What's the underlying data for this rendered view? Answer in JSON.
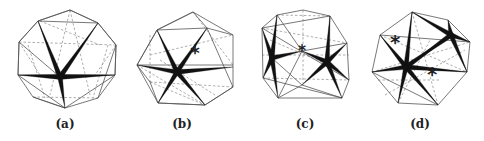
{
  "figure": {
    "panels": [
      {
        "id": "a",
        "label": "(a)",
        "label_x": 65,
        "outline": [
          [
            70,
            10
          ],
          [
            98,
            23
          ],
          [
            116,
            45
          ],
          [
            115,
            75
          ],
          [
            98,
            98
          ],
          [
            65,
            108
          ],
          [
            33,
            97
          ],
          [
            18,
            75
          ],
          [
            19,
            42
          ],
          [
            38,
            21
          ]
        ],
        "edges": [
          [
            [
              38,
              21
            ],
            [
              98,
              23
            ]
          ],
          [
            [
              38,
              21
            ],
            [
              19,
              42
            ]
          ],
          [
            [
              98,
              23
            ],
            [
              116,
              45
            ]
          ],
          [
            [
              19,
              42
            ],
            [
              18,
              75
            ]
          ],
          [
            [
              116,
              45
            ],
            [
              115,
              75
            ]
          ],
          [
            [
              18,
              75
            ],
            [
              115,
              75
            ]
          ],
          [
            [
              18,
              75
            ],
            [
              65,
              108
            ]
          ],
          [
            [
              115,
              75
            ],
            [
              65,
              108
            ]
          ],
          [
            [
              38,
              21
            ],
            [
              60,
              77
            ]
          ],
          [
            [
              98,
              23
            ],
            [
              60,
              77
            ]
          ],
          [
            [
              70,
              10
            ],
            [
              38,
              21
            ]
          ],
          [
            [
              70,
              10
            ],
            [
              98,
              23
            ]
          ],
          [
            [
              19,
              42
            ],
            [
              60,
              77
            ]
          ],
          [
            [
              116,
              45
            ],
            [
              98,
              98
            ]
          ],
          [
            [
              33,
              97
            ],
            [
              65,
              108
            ]
          ]
        ],
        "hidden_edges": [
          [
            [
              19,
              42
            ],
            [
              116,
              45
            ]
          ],
          [
            [
              70,
              10
            ],
            [
              50,
              95
            ]
          ],
          [
            [
              70,
              10
            ],
            [
              90,
              95
            ]
          ],
          [
            [
              28,
              45
            ],
            [
              45,
              98
            ]
          ],
          [
            [
              108,
              45
            ],
            [
              93,
              98
            ]
          ],
          [
            [
              33,
              97
            ],
            [
              98,
              98
            ]
          ],
          [
            [
              19,
              42
            ],
            [
              40,
              75
            ]
          ],
          [
            [
              116,
              45
            ],
            [
              95,
              75
            ]
          ],
          [
            [
              40,
              21
            ],
            [
              100,
              45
            ]
          ]
        ],
        "stars": [
          {
            "center": [
              60,
              77
            ],
            "tips": [
              [
                38,
                21
              ],
              [
                98,
                23
              ],
              [
                18,
                75
              ],
              [
                115,
                75
              ],
              [
                65,
                108
              ]
            ]
          }
        ],
        "asterisks": []
      },
      {
        "id": "b",
        "label": "(b)",
        "label_x": 182,
        "outline": [
          [
            193,
            12
          ],
          [
            233,
            35
          ],
          [
            233,
            87
          ],
          [
            205,
            105
          ],
          [
            158,
            103
          ],
          [
            150,
            82
          ],
          [
            137,
            65
          ],
          [
            157,
            30
          ]
        ],
        "edges": [
          [
            [
              157,
              30
            ],
            [
              207,
              28
            ]
          ],
          [
            [
              207,
              28
            ],
            [
              233,
              35
            ]
          ],
          [
            [
              193,
              12
            ],
            [
              157,
              30
            ]
          ],
          [
            [
              193,
              12
            ],
            [
              207,
              28
            ]
          ],
          [
            [
              157,
              30
            ],
            [
              137,
              65
            ]
          ],
          [
            [
              207,
              28
            ],
            [
              233,
              87
            ]
          ],
          [
            [
              137,
              65
            ],
            [
              233,
              65
            ]
          ],
          [
            [
              158,
              103
            ],
            [
              205,
              105
            ]
          ],
          [
            [
              137,
              65
            ],
            [
              158,
              103
            ]
          ],
          [
            [
              233,
              87
            ],
            [
              205,
              105
            ]
          ],
          [
            [
              157,
              30
            ],
            [
              177,
              72
            ]
          ],
          [
            [
              207,
              28
            ],
            [
              177,
              72
            ]
          ],
          [
            [
              177,
              72
            ],
            [
              158,
              103
            ]
          ],
          [
            [
              177,
              72
            ],
            [
              205,
              105
            ]
          ]
        ],
        "hidden_edges": [
          [
            [
              150,
              35
            ],
            [
              150,
              82
            ]
          ],
          [
            [
              150,
              82
            ],
            [
              233,
              87
            ]
          ],
          [
            [
              150,
              55
            ],
            [
              233,
              35
            ]
          ],
          [
            [
              137,
              65
            ],
            [
              205,
              105
            ]
          ],
          [
            [
              150,
              82
            ],
            [
              205,
              105
            ]
          ],
          [
            [
              193,
              12
            ],
            [
              233,
              65
            ]
          ],
          [
            [
              160,
              60
            ],
            [
              215,
              95
            ]
          ]
        ],
        "stars": [
          {
            "center": [
              177,
              72
            ],
            "tips": [
              [
                157,
                30
              ],
              [
                207,
                28
              ],
              [
                137,
                65
              ],
              [
                233,
                67
              ],
              [
                158,
                103
              ],
              [
                205,
                105
              ]
            ]
          }
        ],
        "asterisks": [
          {
            "pos": [
              195,
              54
            ],
            "size": 13
          }
        ]
      },
      {
        "id": "c",
        "label": "(c)",
        "label_x": 305,
        "outline": [
          [
            277,
            15
          ],
          [
            303,
            10
          ],
          [
            330,
            16
          ],
          [
            347,
            43
          ],
          [
            349,
            80
          ],
          [
            342,
            98
          ],
          [
            278,
            98
          ],
          [
            263,
            78
          ],
          [
            262,
            28
          ]
        ],
        "edges": [
          [
            [
              262,
              28
            ],
            [
              330,
              16
            ]
          ],
          [
            [
              277,
              15
            ],
            [
              272,
              58
            ]
          ],
          [
            [
              277,
              15
            ],
            [
              302,
              51
            ]
          ],
          [
            [
              330,
              16
            ],
            [
              327,
              62
            ]
          ],
          [
            [
              302,
              51
            ],
            [
              347,
              43
            ]
          ],
          [
            [
              262,
              28
            ],
            [
              349,
              80
            ]
          ],
          [
            [
              263,
              78
            ],
            [
              342,
              98
            ]
          ],
          [
            [
              302,
              51
            ],
            [
              278,
              98
            ]
          ],
          [
            [
              302,
              85
            ],
            [
              278,
              98
            ]
          ],
          [
            [
              302,
              85
            ],
            [
              342,
              98
            ]
          ],
          [
            [
              272,
              58
            ],
            [
              302,
              85
            ]
          ]
        ],
        "hidden_edges": [
          [
            [
              303,
              10
            ],
            [
              303,
              85
            ]
          ],
          [
            [
              262,
              28
            ],
            [
              347,
              43
            ]
          ],
          [
            [
              263,
              78
            ],
            [
              349,
              80
            ]
          ],
          [
            [
              262,
              55
            ],
            [
              349,
              55
            ]
          ],
          [
            [
              277,
              15
            ],
            [
              330,
              16
            ]
          ],
          [
            [
              270,
              40
            ],
            [
              340,
              70
            ]
          ]
        ],
        "stars": [
          {
            "center": [
              272,
              58
            ],
            "tips": [
              [
                262,
                28
              ],
              [
                277,
                15
              ],
              [
                263,
                78
              ],
              [
                278,
                98
              ],
              [
                302,
                51
              ]
            ]
          },
          {
            "center": [
              327,
              62
            ],
            "tips": [
              [
                330,
                16
              ],
              [
                347,
                43
              ],
              [
                349,
                80
              ],
              [
                342,
                98
              ],
              [
                302,
                85
              ],
              [
                302,
                51
              ]
            ]
          }
        ],
        "asterisks": [
          {
            "pos": [
              302,
              52
            ],
            "size": 11
          }
        ]
      },
      {
        "id": "d",
        "label": "(d)",
        "label_x": 420,
        "outline": [
          [
            412,
            12
          ],
          [
            448,
            20
          ],
          [
            470,
            42
          ],
          [
            467,
            72
          ],
          [
            438,
            105
          ],
          [
            398,
            103
          ],
          [
            372,
            72
          ],
          [
            380,
            35
          ]
        ],
        "edges": [
          [
            [
              380,
              35
            ],
            [
              470,
              42
            ]
          ],
          [
            [
              412,
              12
            ],
            [
              451,
              35
            ]
          ],
          [
            [
              448,
              20
            ],
            [
              451,
              35
            ]
          ],
          [
            [
              380,
              35
            ],
            [
              406,
              67
            ]
          ],
          [
            [
              406,
              67
            ],
            [
              372,
              72
            ]
          ],
          [
            [
              406,
              67
            ],
            [
              467,
              72
            ]
          ],
          [
            [
              406,
              67
            ],
            [
              398,
              103
            ]
          ],
          [
            [
              406,
              67
            ],
            [
              438,
              105
            ]
          ],
          [
            [
              412,
              12
            ],
            [
              406,
              67
            ]
          ],
          [
            [
              451,
              35
            ],
            [
              467,
              72
            ]
          ],
          [
            [
              372,
              72
            ],
            [
              438,
              105
            ]
          ],
          [
            [
              451,
              35
            ],
            [
              470,
              42
            ]
          ]
        ],
        "hidden_edges": [
          [
            [
              380,
              35
            ],
            [
              467,
              72
            ]
          ],
          [
            [
              385,
              95
            ],
            [
              465,
              50
            ]
          ],
          [
            [
              372,
              72
            ],
            [
              470,
              42
            ]
          ],
          [
            [
              398,
              103
            ],
            [
              430,
              40
            ]
          ],
          [
            [
              412,
              12
            ],
            [
              438,
              105
            ]
          ],
          [
            [
              378,
              80
            ],
            [
              440,
              80
            ]
          ]
        ],
        "stars": [
          {
            "center": [
              406,
              67
            ],
            "tips": [
              [
                380,
                35
              ],
              [
                412,
                12
              ],
              [
                451,
                35
              ],
              [
                372,
                72
              ],
              [
                467,
                72
              ],
              [
                398,
                103
              ],
              [
                438,
                105
              ]
            ]
          },
          {
            "center": [
              451,
              35
            ],
            "tips": [
              [
                412,
                12
              ],
              [
                448,
                20
              ],
              [
                470,
                42
              ],
              [
                467,
                72
              ],
              [
                406,
                67
              ]
            ]
          }
        ],
        "asterisks": [
          {
            "pos": [
              395,
              44
            ],
            "size": 14
          },
          {
            "pos": [
              432,
              76
            ],
            "size": 14
          }
        ]
      }
    ]
  }
}
